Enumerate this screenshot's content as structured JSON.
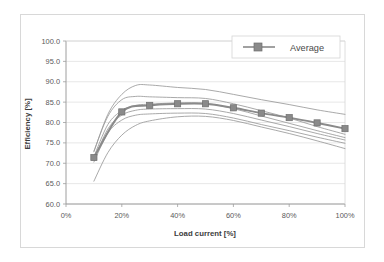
{
  "chart_data": {
    "type": "line",
    "title": "",
    "xlabel": "Load current [%]",
    "ylabel": "Efficiency [%]",
    "xlim": [
      0,
      100
    ],
    "ylim": [
      60.0,
      100.0
    ],
    "xticks": [
      0,
      20,
      40,
      60,
      80,
      100
    ],
    "xtick_labels": [
      "0%",
      "20%",
      "40%",
      "60%",
      "80%",
      "100%"
    ],
    "yticks": [
      60.0,
      65.0,
      70.0,
      75.0,
      80.0,
      85.0,
      90.0,
      95.0,
      100.0
    ],
    "ytick_labels": [
      "60.0",
      "65.0",
      "70.0",
      "75.0",
      "80.0",
      "85.0",
      "90.0",
      "95.0",
      "100.0"
    ],
    "grid": "horizontal",
    "legend_position": "top-right",
    "legend_entries": [
      "Average"
    ],
    "series": [
      {
        "name": "Average",
        "highlighted": true,
        "marker": "square",
        "color": "#8a8a8a",
        "x": [
          10,
          20,
          30,
          40,
          50,
          60,
          70,
          80,
          90,
          100
        ],
        "values": [
          71.4,
          82.6,
          84.2,
          84.6,
          84.6,
          83.6,
          82.3,
          81.2,
          79.9,
          78.5
        ]
      },
      {
        "name": "unit-1",
        "highlighted": false,
        "marker": "none",
        "color": "#9a9a9a",
        "x": [
          10,
          15,
          20,
          25,
          30,
          40,
          50,
          60,
          70,
          80,
          90,
          100
        ],
        "values": [
          72.8,
          82.0,
          86.9,
          89.1,
          89.2,
          88.6,
          88.1,
          86.9,
          85.6,
          84.4,
          83.1,
          82.0
        ]
      },
      {
        "name": "unit-2",
        "highlighted": false,
        "marker": "none",
        "color": "#9a9a9a",
        "x": [
          10,
          15,
          20,
          25,
          30,
          40,
          50,
          60,
          70,
          80,
          90,
          100
        ],
        "values": [
          73.0,
          81.5,
          85.6,
          86.4,
          86.3,
          86.1,
          85.9,
          84.6,
          82.9,
          81.1,
          79.0,
          77.1
        ]
      },
      {
        "name": "unit-3",
        "highlighted": false,
        "marker": "none",
        "color": "#9a9a9a",
        "x": [
          10,
          15,
          20,
          25,
          30,
          40,
          50,
          60,
          70,
          80,
          90,
          100
        ],
        "values": [
          71.6,
          79.5,
          82.9,
          84.2,
          84.5,
          84.8,
          84.7,
          83.4,
          81.6,
          79.8,
          78.0,
          76.3
        ]
      },
      {
        "name": "unit-4",
        "highlighted": false,
        "marker": "none",
        "color": "#9a9a9a",
        "x": [
          10,
          15,
          20,
          25,
          30,
          40,
          50,
          60,
          70,
          80,
          90,
          100
        ],
        "values": [
          70.9,
          78.4,
          81.8,
          83.0,
          83.3,
          83.4,
          83.3,
          82.2,
          80.6,
          79.0,
          77.3,
          75.7
        ]
      },
      {
        "name": "unit-5",
        "highlighted": false,
        "marker": "none",
        "color": "#9a9a9a",
        "x": [
          10,
          15,
          20,
          25,
          30,
          40,
          50,
          60,
          70,
          80,
          90,
          100
        ],
        "values": [
          70.3,
          77.4,
          80.6,
          81.8,
          82.1,
          82.3,
          82.2,
          81.1,
          79.5,
          78.0,
          76.4,
          74.9
        ]
      },
      {
        "name": "unit-6",
        "highlighted": false,
        "marker": "none",
        "color": "#9a9a9a",
        "x": [
          10,
          15,
          20,
          25,
          30,
          40,
          50,
          60,
          70,
          80,
          90,
          100
        ],
        "values": [
          65.6,
          72.6,
          76.9,
          79.3,
          80.4,
          81.4,
          81.5,
          80.5,
          78.9,
          77.3,
          75.5,
          73.6
        ]
      }
    ]
  },
  "legend": {
    "average_label": "Average"
  },
  "axes": {
    "x_title": "Load current [%]",
    "y_title": "Efficiency [%]"
  }
}
